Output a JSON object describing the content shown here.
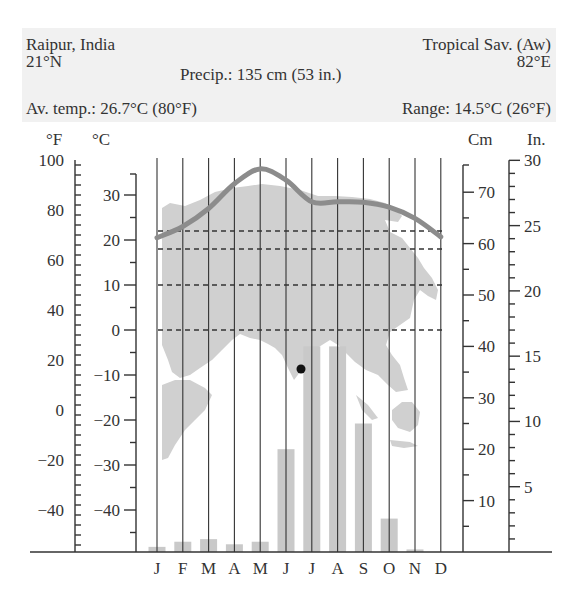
{
  "header": {
    "location": "Raipur, India",
    "latitude": "21°N",
    "climate_type": "Tropical Sav. (Aw)",
    "longitude": "82°E",
    "precip": "Precip.: 135 cm (53 in.)",
    "avg_temp": "Av. temp.: 26.7°C (80°F)",
    "range": "Range: 14.5°C (26°F)"
  },
  "axes": {
    "f_label": "°F",
    "c_label": "°C",
    "cm_label": "Cm",
    "in_label": "In.",
    "f_ticks": [
      100,
      80,
      60,
      40,
      20,
      0,
      -20,
      -40
    ],
    "c_ticks": [
      30,
      20,
      10,
      0,
      -10,
      -20,
      -30,
      -40
    ],
    "cm_ticks": [
      70,
      60,
      50,
      40,
      30,
      20,
      10
    ],
    "in_ticks": [
      30,
      25,
      20,
      15,
      10,
      5
    ]
  },
  "colors": {
    "temp_line": "#8c8c8c",
    "bars": "#c9c9c9",
    "map": "#d0d0d0",
    "axis": "#333333",
    "dot": "#111111"
  },
  "chart_data": {
    "type": "bar+line",
    "categories": [
      "J",
      "F",
      "M",
      "A",
      "M",
      "J",
      "J",
      "A",
      "S",
      "O",
      "N",
      "D"
    ],
    "series": [
      {
        "name": "Temperature (°C)",
        "type": "line",
        "axis": "left",
        "values": [
          20.5,
          23,
          27,
          32.5,
          35.8,
          33.3,
          28.5,
          28.5,
          28.4,
          27.3,
          24.8,
          20.7
        ]
      },
      {
        "name": "Precipitation (cm)",
        "type": "bar",
        "axis": "right",
        "values": [
          1,
          2,
          2.5,
          1.5,
          2,
          20,
          40,
          40,
          25,
          6.5,
          0.5,
          0
        ]
      }
    ],
    "reference_lines_c": [
      22,
      18,
      10,
      0
    ],
    "ylim_c": [
      -49,
      40
    ],
    "ylim_f": [
      -56,
      104
    ],
    "ylim_cm": [
      0,
      75
    ],
    "ylim_in": [
      0,
      30
    ],
    "xlabel": "",
    "ylabel_left": "°F / °C",
    "ylabel_right": "Cm / In.",
    "grid": "vertical month lines",
    "annotations": [
      "Precip.: 135 cm (53 in.)",
      "Av. temp.: 26.7°C (80°F)",
      "Range: 14.5°C (26°F)"
    ]
  }
}
